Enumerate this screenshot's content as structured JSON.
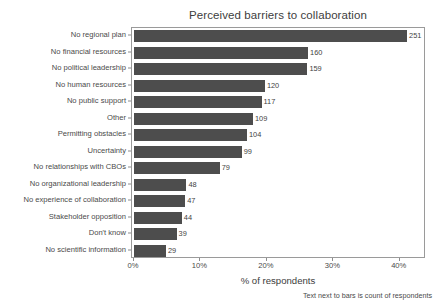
{
  "chart_data": {
    "type": "bar",
    "orientation": "horizontal",
    "title": "Perceived barriers to collaboration",
    "xlabel": "% of respondents",
    "ylabel": "",
    "caption": "Text next to bars is count of respondents",
    "xlim": [
      0,
      43.8
    ],
    "xticks": [
      0,
      10,
      20,
      30,
      40
    ],
    "xticklabels": [
      "0%",
      "10%",
      "20%",
      "30%",
      "40%"
    ],
    "grid": false,
    "legend": null,
    "bar_color": "#4d4d4d",
    "panel_border_color": "#9a9a9a",
    "text_color": "#4a4a4a",
    "background": "#ffffff",
    "value_label_note": "counts of respondents shown next to each bar",
    "categories": [
      "No regional plan",
      "No financial resources",
      "No political leadership",
      "No human resources",
      "No public support",
      "Other",
      "Permitting obstacles",
      "Uncertainty",
      "No relationships with CBOs",
      "No organizational leadership",
      "No experience of collaboration",
      "Stakeholder opposition",
      "Don't know",
      "No scientific information"
    ],
    "counts": [
      251,
      160,
      159,
      120,
      117,
      109,
      104,
      99,
      79,
      48,
      47,
      44,
      39,
      29
    ],
    "values": [
      41.1,
      26.2,
      26.1,
      19.7,
      19.2,
      17.9,
      17.0,
      16.2,
      12.9,
      7.9,
      7.7,
      7.2,
      6.4,
      4.8
    ],
    "bars": [
      {
        "label": "No regional plan",
        "count": 251,
        "percent": 41.1
      },
      {
        "label": "No financial resources",
        "count": 160,
        "percent": 26.2
      },
      {
        "label": "No political leadership",
        "count": 159,
        "percent": 26.1
      },
      {
        "label": "No human resources",
        "count": 120,
        "percent": 19.7
      },
      {
        "label": "No public support",
        "count": 117,
        "percent": 19.2
      },
      {
        "label": "Other",
        "count": 109,
        "percent": 17.9
      },
      {
        "label": "Permitting obstacles",
        "count": 104,
        "percent": 17.0
      },
      {
        "label": "Uncertainty",
        "count": 99,
        "percent": 16.2
      },
      {
        "label": "No relationships with CBOs",
        "count": 79,
        "percent": 12.9
      },
      {
        "label": "No organizational leadership",
        "count": 48,
        "percent": 7.9
      },
      {
        "label": "No experience of collaboration",
        "count": 47,
        "percent": 7.7
      },
      {
        "label": "Stakeholder opposition",
        "count": 44,
        "percent": 7.2
      },
      {
        "label": "Don't know",
        "count": 39,
        "percent": 6.4
      },
      {
        "label": "No scientific information",
        "count": 29,
        "percent": 4.8
      }
    ]
  }
}
